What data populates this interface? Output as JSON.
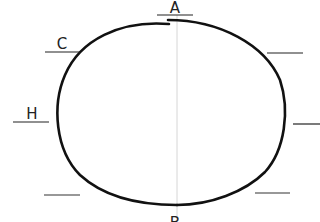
{
  "diagram": {
    "type": "labeled-oval-worksheet",
    "labels": [
      {
        "id": "A",
        "text": "A",
        "x": 175,
        "y": 14,
        "line": [
          157,
          15,
          193,
          15
        ]
      },
      {
        "id": "C",
        "text": "C",
        "x": 62,
        "y": 49,
        "line": [
          45,
          52,
          80,
          52
        ]
      },
      {
        "id": "H",
        "text": "H",
        "x": 32,
        "y": 119,
        "line": [
          13,
          122,
          49,
          122
        ]
      },
      {
        "id": "B",
        "text": "B",
        "x": 175,
        "y": 226,
        "line": null
      }
    ],
    "blanks": [
      {
        "id": "blank-right-top",
        "line": [
          267,
          53,
          303,
          53
        ]
      },
      {
        "id": "blank-right-middle",
        "line": [
          293,
          124,
          320,
          124
        ]
      },
      {
        "id": "blank-left-bottom",
        "line": [
          44,
          195,
          80,
          195
        ]
      },
      {
        "id": "blank-right-bottom",
        "line": [
          255,
          193,
          290,
          193
        ]
      }
    ],
    "axis_line": {
      "x": 177,
      "y1": 15,
      "y2": 222,
      "color": "#cccccc"
    },
    "colors": {
      "stroke": "#111111",
      "text": "#222222",
      "guide": "#cccccc"
    }
  }
}
